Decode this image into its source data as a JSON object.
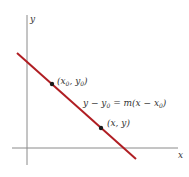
{
  "diagram": {
    "axes": {
      "x_label": "x",
      "y_label": "y",
      "axis_color": "#8a8a8a"
    },
    "line": {
      "color": "#b01e23",
      "equation_prefix": "y − y",
      "equation_sub0": "0",
      "equation_mid": " = m(x − x",
      "equation_sub1": "0",
      "equation_suffix": ")"
    },
    "points": [
      {
        "label_prefix": "(x",
        "sub_a": "0",
        "label_mid": ", y",
        "sub_b": "0",
        "label_suffix": ")"
      },
      {
        "label": "(x, y)"
      }
    ],
    "point_color": "#1a1a1a"
  }
}
